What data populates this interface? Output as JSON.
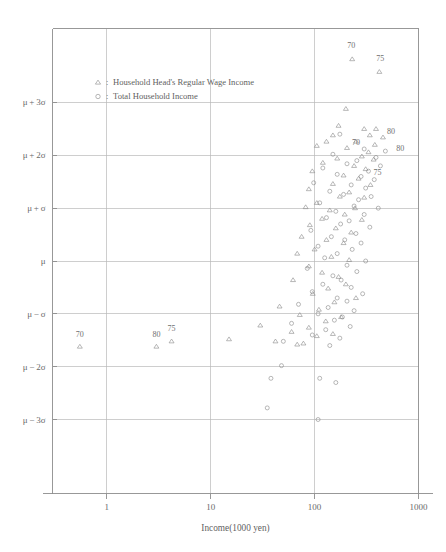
{
  "chart_data": {
    "type": "scatter",
    "title": "",
    "xlabel": "Income(1000 yen)",
    "ylabel": "",
    "xscale": "log",
    "xlim": [
      0.3,
      1000
    ],
    "xticks": [
      "1",
      "10",
      "100",
      "1000"
    ],
    "xtick_values": [
      1,
      10,
      100,
      1000
    ],
    "yticks": [
      "μ + 3σ",
      "μ + 2σ",
      "μ + σ",
      "μ",
      "μ − σ",
      "μ − 2σ",
      "μ − 3σ"
    ],
    "ytick_values": [
      3,
      2,
      1,
      0,
      -1,
      -2,
      -3
    ],
    "ylim": [
      -4.4,
      4.4
    ],
    "grid": true,
    "legend_position": "upper-left-inside",
    "legend": [
      {
        "marker": "triangle",
        "separator": ":",
        "label": "Household Head's Regular Wage Income"
      },
      {
        "marker": "circle",
        "separator": ":",
        "label": "Total Household Income"
      }
    ],
    "series": [
      {
        "name": "Household Head's Regular Wage Income",
        "marker": "triangle",
        "points": [
          [
            230,
            3.82
          ],
          [
            420,
            3.58
          ],
          [
            200,
            2.88
          ],
          [
            170,
            2.56
          ],
          [
            300,
            2.5
          ],
          [
            390,
            2.5
          ],
          [
            150,
            2.38
          ],
          [
            340,
            2.38
          ],
          [
            455,
            2.34
          ],
          [
            130,
            2.26
          ],
          [
            250,
            2.26
          ],
          [
            380,
            2.2
          ],
          [
            105,
            2.18
          ],
          [
            205,
            2.14
          ],
          [
            330,
            2.06
          ],
          [
            285,
            1.98
          ],
          [
            165,
            1.94
          ],
          [
            370,
            1.92
          ],
          [
            120,
            1.86
          ],
          [
            240,
            1.8
          ],
          [
            310,
            1.74
          ],
          [
            95,
            1.7
          ],
          [
            190,
            1.62
          ],
          [
            265,
            1.56
          ],
          [
            150,
            1.46
          ],
          [
            345,
            1.44
          ],
          [
            88,
            1.36
          ],
          [
            215,
            1.3
          ],
          [
            175,
            1.22
          ],
          [
            300,
            1.2
          ],
          [
            105,
            1.1
          ],
          [
            82,
            1.02
          ],
          [
            245,
            1.0
          ],
          [
            140,
            0.96
          ],
          [
            195,
            0.88
          ],
          [
            118,
            0.8
          ],
          [
            285,
            0.78
          ],
          [
            90,
            0.68
          ],
          [
            160,
            0.62
          ],
          [
            225,
            0.54
          ],
          [
            75,
            0.46
          ],
          [
            130,
            0.4
          ],
          [
            190,
            0.34
          ],
          [
            100,
            0.22
          ],
          [
            68,
            0.14
          ],
          [
            145,
            0.08
          ],
          [
            215,
            0.02
          ],
          [
            88,
            -0.1
          ],
          [
            118,
            -0.22
          ],
          [
            170,
            -0.3
          ],
          [
            62,
            -0.36
          ],
          [
            200,
            -0.44
          ],
          [
            135,
            -0.52
          ],
          [
            96,
            -0.62
          ],
          [
            250,
            -0.7
          ],
          [
            155,
            -0.78
          ],
          [
            46,
            -0.86
          ],
          [
            110,
            -0.92
          ],
          [
            72,
            -1.02
          ],
          [
            180,
            -1.06
          ],
          [
            128,
            -1.14
          ],
          [
            30,
            -1.22
          ],
          [
            88,
            -1.26
          ],
          [
            60,
            -1.34
          ],
          [
            150,
            -1.38
          ],
          [
            105,
            -1.42
          ],
          [
            15,
            -1.48
          ],
          [
            42,
            -1.52
          ],
          [
            78,
            -1.56
          ],
          [
            68,
            -1.58
          ],
          [
            0.55,
            -1.62
          ],
          [
            3,
            -1.62
          ],
          [
            4.2,
            -1.52
          ]
        ]
      },
      {
        "name": "Total Household Income",
        "marker": "circle",
        "points": [
          [
            175,
            2.4
          ],
          [
            300,
            2.12
          ],
          [
            480,
            2.08
          ],
          [
            150,
            2.02
          ],
          [
            390,
            1.96
          ],
          [
            255,
            1.9
          ],
          [
            205,
            1.84
          ],
          [
            430,
            1.8
          ],
          [
            120,
            1.76
          ],
          [
            330,
            1.7
          ],
          [
            165,
            1.64
          ],
          [
            280,
            1.6
          ],
          [
            375,
            1.54
          ],
          [
            98,
            1.48
          ],
          [
            225,
            1.44
          ],
          [
            310,
            1.38
          ],
          [
            140,
            1.32
          ],
          [
            190,
            1.26
          ],
          [
            350,
            1.22
          ],
          [
            265,
            1.16
          ],
          [
            112,
            1.1
          ],
          [
            240,
            1.04
          ],
          [
            410,
            1.0
          ],
          [
            160,
            0.94
          ],
          [
            300,
            0.88
          ],
          [
            130,
            0.82
          ],
          [
            215,
            0.76
          ],
          [
            178,
            0.7
          ],
          [
            340,
            0.64
          ],
          [
            92,
            0.58
          ],
          [
            250,
            0.52
          ],
          [
            145,
            0.46
          ],
          [
            195,
            0.4
          ],
          [
            280,
            0.34
          ],
          [
            108,
            0.28
          ],
          [
            230,
            0.22
          ],
          [
            165,
            0.14
          ],
          [
            125,
            0.06
          ],
          [
            310,
            0.0
          ],
          [
            205,
            -0.08
          ],
          [
            85,
            -0.14
          ],
          [
            255,
            -0.2
          ],
          [
            150,
            -0.28
          ],
          [
            180,
            -0.36
          ],
          [
            120,
            -0.44
          ],
          [
            225,
            -0.5
          ],
          [
            95,
            -0.58
          ],
          [
            290,
            -0.62
          ],
          [
            165,
            -0.7
          ],
          [
            205,
            -0.76
          ],
          [
            70,
            -0.82
          ],
          [
            135,
            -0.88
          ],
          [
            240,
            -0.94
          ],
          [
            108,
            -1.0
          ],
          [
            185,
            -1.06
          ],
          [
            155,
            -1.12
          ],
          [
            60,
            -1.18
          ],
          [
            220,
            -1.24
          ],
          [
            128,
            -1.3
          ],
          [
            95,
            -1.4
          ],
          [
            175,
            -1.46
          ],
          [
            50,
            -1.52
          ],
          [
            140,
            -1.6
          ],
          [
            48,
            -1.98
          ],
          [
            38,
            -2.22
          ],
          [
            112,
            -2.22
          ],
          [
            160,
            -2.3
          ],
          [
            35,
            -2.78
          ],
          [
            108,
            -3.0
          ]
        ]
      }
    ],
    "annotations": [
      {
        "text": "70",
        "x": 230,
        "y": 3.82,
        "dx": -1,
        "dy": 11
      },
      {
        "text": "75",
        "x": 420,
        "y": 3.58,
        "dx": 1,
        "dy": 11
      },
      {
        "text": "80",
        "x": 455,
        "y": 2.34,
        "dx": 8,
        "dy": 3
      },
      {
        "text": "80",
        "x": 560,
        "y": 2.02,
        "dx": 8,
        "dy": 3
      },
      {
        "text": "70",
        "x": 205,
        "y": 2.14,
        "dx": 9,
        "dy": 3
      },
      {
        "text": "75",
        "x": 330,
        "y": 1.58,
        "dx": 9,
        "dy": 3
      },
      {
        "text": "70",
        "x": 0.55,
        "y": -1.62,
        "dx": 0,
        "dy": 10
      },
      {
        "text": "80",
        "x": 3,
        "y": -1.62,
        "dx": 0,
        "dy": 10
      },
      {
        "text": "75",
        "x": 4.2,
        "y": -1.52,
        "dx": 0,
        "dy": 10
      }
    ]
  },
  "colors": {
    "background": "#ffffff",
    "frame": "#8d8d8d",
    "grid": "#b9b9b9",
    "marker": "#8b8b8b",
    "text": "#5f5f5f"
  }
}
